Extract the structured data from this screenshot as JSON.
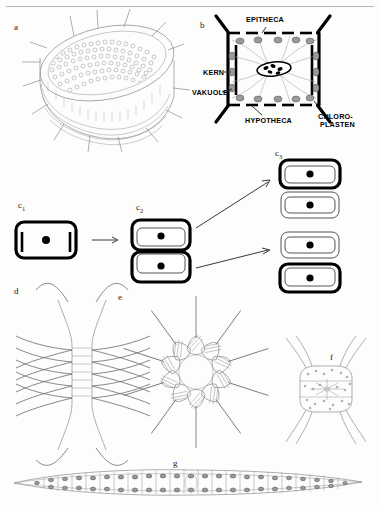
{
  "figure": {
    "background": "#fdfdfc",
    "ink": "#111111"
  },
  "panels": [
    {
      "id": "a",
      "label": "a",
      "caption": "centric diatom frustule in oblique view with marginal spines"
    },
    {
      "id": "b",
      "label": "b",
      "caption": "cell cross-section with labelled organelles"
    },
    {
      "id": "c1",
      "label": "c",
      "sub": "1",
      "caption": "parent cell before division"
    },
    {
      "id": "c2",
      "label": "c",
      "sub": "2",
      "caption": "cell after protoplast division"
    },
    {
      "id": "c3",
      "label": "c",
      "sub": "3",
      "caption": "two daughter cells with new hypothecae"
    },
    {
      "id": "d",
      "label": "d",
      "caption": "chain colony with crossing setae"
    },
    {
      "id": "e",
      "label": "e",
      "caption": "stellate colony of wedge-shaped cells"
    },
    {
      "id": "f",
      "label": "f",
      "caption": "single cell with four horns"
    },
    {
      "id": "g",
      "label": "g",
      "caption": "elongated spindle-shaped filament colony"
    }
  ],
  "annotations": {
    "epitheca": "EPITHECA",
    "hypotheca": "HYPOTHECA",
    "kern": "KERN",
    "vakuole": "VAKUOLE",
    "chloroplasten_line1": "CHLORO-",
    "chloroplasten_line2": "PLASTEN"
  },
  "colors": {
    "outline_dark": "#000000",
    "outline_mid": "#6a6a6a",
    "outline_light": "#a0a0a0",
    "chloroplast_fill": "#9a9a9a",
    "paper": "#fdfdfc",
    "rule": "#b9b9b9"
  },
  "counts": {
    "panel_e_cells": 10,
    "panel_c3_pairs": 2,
    "panel_g_cells": 26
  }
}
